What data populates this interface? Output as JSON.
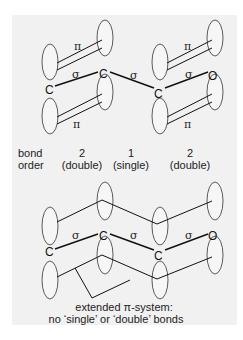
{
  "top_diagram": {
    "atoms": [
      "C",
      "C",
      "C",
      "O"
    ],
    "sigma_labels": [
      "σ",
      "σ",
      "σ"
    ],
    "pi_labels": [
      "π",
      "π",
      "π",
      "π"
    ],
    "bond_order_label_line1": "bond",
    "bond_order_label_line2": "order",
    "bond_orders": [
      {
        "value": "2",
        "type": "(double)"
      },
      {
        "value": "1",
        "type": "(single)"
      },
      {
        "value": "2",
        "type": "(double)"
      }
    ]
  },
  "bottom_diagram": {
    "atoms": [
      "C",
      "C",
      "C",
      "O"
    ],
    "sigma_labels": [
      "σ",
      "σ",
      "σ"
    ],
    "caption_line1": "extended π-system:",
    "caption_line2": "no ‘single’ or ‘double’ bonds"
  }
}
